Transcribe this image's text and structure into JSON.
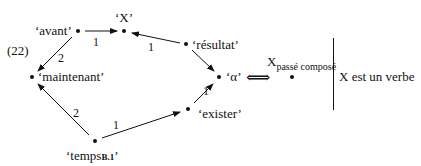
{
  "example_number": "(22)",
  "nodes": {
    "avant": "‘avant’",
    "x": "‘X’",
    "resultat": "‘résultat’",
    "maintenant": "‘maintenant’",
    "alpha": "‘α’",
    "exister": "‘exister’",
    "temps_prefix": "‘temps",
    "temps_sub": "B.1",
    "temps_suffix": "’"
  },
  "edges": [
    {
      "from": "avant",
      "to": "X",
      "weight": "1"
    },
    {
      "from": "résultat",
      "to": "X",
      "weight": "1"
    },
    {
      "from": "avant",
      "to": "maintenant",
      "weight": "2"
    },
    {
      "from": "résultat",
      "to": "α",
      "weight": ""
    },
    {
      "from": "exister",
      "to": "α",
      "weight": "1"
    },
    {
      "from": "temps B.1",
      "to": "maintenant",
      "weight": "2"
    },
    {
      "from": "temps B.1",
      "to": "exister",
      "weight": "1"
    }
  ],
  "equivalence_symbol": "⟺",
  "rhs": {
    "x": "X",
    "x_subscript": "passé composé",
    "condition": "X est un verbe"
  }
}
